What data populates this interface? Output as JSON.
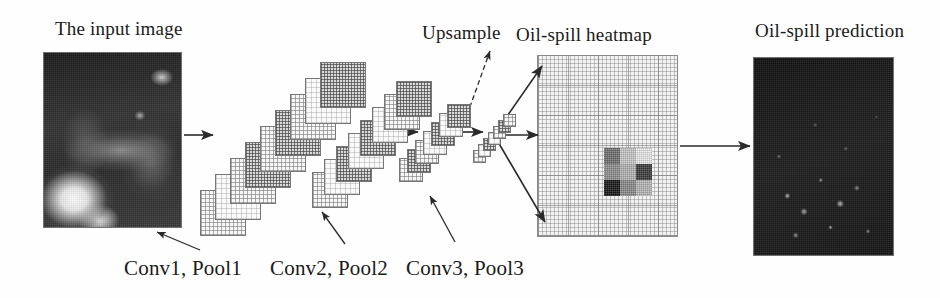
{
  "figure": {
    "type": "diagram",
    "background_color": "#ffffff",
    "text_color": "#1a1a1a"
  },
  "titles": {
    "input": "The input image",
    "upsample": "Upsample",
    "heatmap": "Oil-spill heatmap",
    "prediction": "Oil-spill prediction"
  },
  "stage_labels": [
    {
      "text": "Conv1, Pool1"
    },
    {
      "text": "Conv2, Pool2"
    },
    {
      "text": "Conv3, Pool3"
    }
  ],
  "panels": {
    "input_image": {
      "name": "input-sar-image",
      "x": 43,
      "y": 52,
      "w": 139,
      "h": 176
    },
    "heatmap": {
      "name": "oil-spill-heatmap",
      "x": 537,
      "y": 55,
      "w": 141,
      "h": 182
    },
    "prediction_image": {
      "name": "oil-spill-prediction-image",
      "x": 753,
      "y": 57,
      "w": 141,
      "h": 199
    }
  },
  "heatmap_block": {
    "rows": 3,
    "cols": 3,
    "cells": [
      {
        "shade": "#6f6f6f"
      },
      {
        "shade": "#c9c9c9"
      },
      {
        "shade": "#ececec"
      },
      {
        "shade": "#8f8f8f"
      },
      {
        "shade": "#b4b4b4"
      },
      {
        "shade": "#3a3a3a"
      },
      {
        "shade": "#141414"
      },
      {
        "shade": "#8a8a8a"
      },
      {
        "shade": "#b8b8b8"
      }
    ]
  },
  "conv_stacks": [
    {
      "name": "conv1-pool1-stack",
      "count": 9,
      "size": 46,
      "origin_x": 200,
      "origin_y": 190,
      "step_x": 15,
      "step_y": -16,
      "dark_indices": [
        3,
        5,
        8
      ]
    },
    {
      "name": "conv2-pool2-stack",
      "count": 8,
      "size": 36,
      "origin_x": 312,
      "origin_y": 172,
      "step_x": 12,
      "step_y": -13,
      "dark_indices": [
        2,
        4,
        7
      ]
    },
    {
      "name": "conv3-pool3-stack",
      "count": 7,
      "size": 24,
      "origin_x": 399,
      "origin_y": 158,
      "step_x": 8,
      "step_y": -9,
      "dark_indices": [
        1,
        4,
        6
      ]
    },
    {
      "name": "upsample-stack",
      "count": 7,
      "size": 13,
      "origin_x": 473,
      "origin_y": 150,
      "step_x": 5,
      "step_y": -6,
      "dark_indices": [
        2,
        5
      ]
    }
  ],
  "flow_arrows": [
    {
      "name": "arrow-input-to-conv1",
      "x1": 184,
      "y1": 135,
      "x2": 213,
      "y2": 135
    },
    {
      "name": "arrow-conv1-to-conv2",
      "x1": 290,
      "y1": 133,
      "x2": 330,
      "y2": 133
    },
    {
      "name": "arrow-conv2-to-conv3",
      "x1": 387,
      "y1": 132,
      "x2": 418,
      "y2": 132
    },
    {
      "name": "arrow-conv3-to-upsample",
      "x1": 455,
      "y1": 132,
      "x2": 483,
      "y2": 132
    },
    {
      "name": "arrow-upsample-to-heatmap-top",
      "x1": 494,
      "y1": 135,
      "x2": 542,
      "y2": 66
    },
    {
      "name": "arrow-upsample-to-heatmap-middle",
      "x1": 494,
      "y1": 135,
      "x2": 538,
      "y2": 135
    },
    {
      "name": "arrow-upsample-to-heatmap-bottom",
      "x1": 494,
      "y1": 135,
      "x2": 545,
      "y2": 222
    },
    {
      "name": "arrow-heatmap-to-prediction",
      "x1": 680,
      "y1": 146,
      "x2": 750,
      "y2": 146
    }
  ],
  "pointer_arrows": [
    {
      "name": "pointer-conv1",
      "x1": 200,
      "y1": 250,
      "x2": 157,
      "y2": 232,
      "style": "solid"
    },
    {
      "name": "pointer-conv2",
      "x1": 345,
      "y1": 244,
      "x2": 322,
      "y2": 212,
      "style": "solid"
    },
    {
      "name": "pointer-conv3",
      "x1": 455,
      "y1": 242,
      "x2": 430,
      "y2": 196,
      "style": "solid"
    },
    {
      "name": "pointer-upsample",
      "x1": 467,
      "y1": 115,
      "x2": 490,
      "y2": 51,
      "style": "dashed"
    }
  ]
}
